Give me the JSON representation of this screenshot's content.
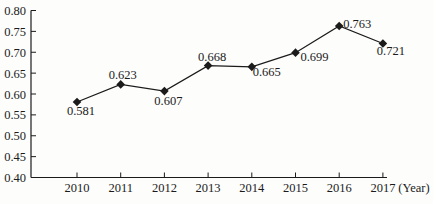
{
  "chart_data": {
    "type": "line",
    "title": "",
    "xlabel": "(Year)",
    "ylabel": "",
    "categories": [
      "2010",
      "2011",
      "2012",
      "2013",
      "2014",
      "2015",
      "2016",
      "2017"
    ],
    "series": [
      {
        "name": "value",
        "values": [
          0.581,
          0.623,
          0.607,
          0.668,
          0.665,
          0.699,
          0.763,
          0.721
        ],
        "point_labels": [
          "0.581",
          "0.623",
          "0.607",
          "0.668",
          "0.665",
          "0.699",
          "0.763",
          "0.721"
        ]
      }
    ],
    "ylim": [
      0.4,
      0.8
    ],
    "ytick_step": 0.05,
    "ytick_labels": [
      "0.40",
      "0.45",
      "0.50",
      "0.55",
      "0.60",
      "0.65",
      "0.70",
      "0.75",
      "0.80"
    ],
    "grid": false,
    "legend": null,
    "marker": "diamond",
    "line_color": "#1b1b1b",
    "text_color": "#1b1b1b",
    "background_color": "#fdfdfc"
  }
}
